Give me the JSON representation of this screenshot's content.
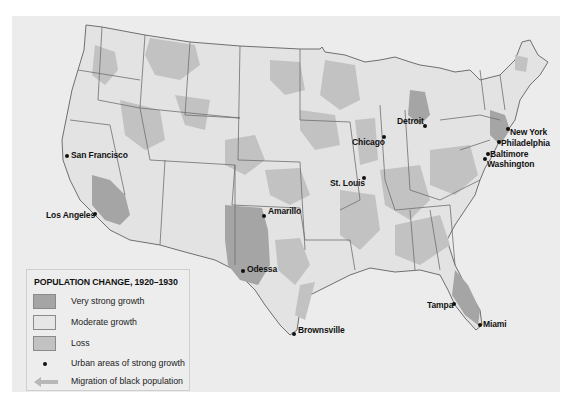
{
  "map": {
    "colors": {
      "very_strong_growth": "#a5a5a5",
      "moderate_growth": "#e3e3e3",
      "loss": "#c2c2c2",
      "state_border": "#6f6f6f",
      "background": "#ececec"
    }
  },
  "legend": {
    "title": "POPULATION CHANGE, 1920–1930",
    "items": [
      {
        "label": "Very strong growth",
        "type": "swatch",
        "color": "#a5a5a5"
      },
      {
        "label": "Moderate growth",
        "type": "swatch",
        "color": "#e6e6e6"
      },
      {
        "label": "Loss",
        "type": "swatch",
        "color": "#c2c2c2"
      },
      {
        "label": "Urban areas of strong growth",
        "type": "dot",
        "color": "#111111"
      },
      {
        "label": "Migration of black population",
        "type": "arrow",
        "color": "#b8b8b8"
      }
    ]
  },
  "cities": [
    {
      "name": "San Francisco",
      "dot": [
        67,
        156
      ],
      "label": [
        71,
        150
      ]
    },
    {
      "name": "Los Angeles",
      "dot": [
        95,
        214
      ],
      "label": [
        46,
        210
      ]
    },
    {
      "name": "Amarillo",
      "dot": [
        264,
        216
      ],
      "label": [
        268,
        206
      ]
    },
    {
      "name": "Odessa",
      "dot": [
        243,
        271
      ],
      "label": [
        247,
        264
      ]
    },
    {
      "name": "Brownsville",
      "dot": [
        293,
        334
      ],
      "label": [
        298,
        325
      ]
    },
    {
      "name": "Chicago",
      "dot": [
        383,
        137
      ],
      "label": [
        352,
        138
      ]
    },
    {
      "name": "St. Louis",
      "dot": [
        364,
        178
      ],
      "label": [
        330,
        179
      ]
    },
    {
      "name": "Detroit",
      "dot": [
        424,
        126
      ],
      "label": [
        397,
        117
      ]
    },
    {
      "name": "New York",
      "dot": [
        507,
        129
      ],
      "label": [
        510,
        127
      ]
    },
    {
      "name": "Philadelphia",
      "dot": [
        498,
        142
      ],
      "label": [
        501,
        138
      ]
    },
    {
      "name": "Baltimore",
      "dot": [
        487,
        154
      ],
      "label": [
        490,
        150
      ]
    },
    {
      "name": "Washington",
      "dot": [
        484,
        159
      ],
      "label": [
        487,
        159
      ]
    },
    {
      "name": "Tampa",
      "dot": [
        453,
        304
      ],
      "label": [
        427,
        301
      ]
    },
    {
      "name": "Miami",
      "dot": [
        479,
        325
      ],
      "label": [
        483,
        320
      ]
    }
  ]
}
